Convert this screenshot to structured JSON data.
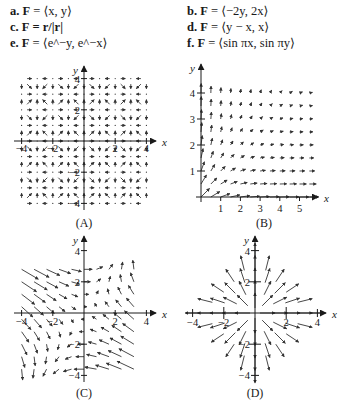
{
  "equations": [
    {
      "letter": "a.",
      "lhs": "F",
      "rhs": "= ⟨x, y⟩",
      "col": 0,
      "row": 0
    },
    {
      "letter": "b.",
      "lhs": "F",
      "rhs": "= ⟨−2y, 2x⟩",
      "col": 1,
      "row": 0
    },
    {
      "letter": "c.",
      "lhs": "F",
      "rhs": "= r/|r|",
      "col": 0,
      "row": 1
    },
    {
      "letter": "d.",
      "lhs": "F",
      "rhs": "= ⟨y − x, x⟩",
      "col": 1,
      "row": 1
    },
    {
      "letter": "e.",
      "lhs": "F",
      "rhs": "= ⟨e^−y, e^−x⟩",
      "col": 0,
      "row": 2
    },
    {
      "letter": "f.",
      "lhs": "F",
      "rhs": "= ⟨sin πx, sin πy⟩",
      "col": 1,
      "row": 2
    }
  ],
  "plots": [
    {
      "id": "A",
      "caption": "(A)",
      "field": "sin_pi",
      "xlabel": "x",
      "ylabel": "y",
      "xticks": [
        "−4",
        "−2",
        "2",
        "4"
      ],
      "yticks": [
        "4",
        "2",
        "−2",
        "−4"
      ]
    },
    {
      "id": "B",
      "caption": "(B)",
      "field": "exp",
      "xlabel": "x",
      "ylabel": "y",
      "xticks": [
        "1",
        "2",
        "3",
        "4",
        "5"
      ],
      "yticks": [
        "1",
        "2",
        "3",
        "4"
      ]
    },
    {
      "id": "C",
      "caption": "(C)",
      "field": "yminusx",
      "xlabel": "x",
      "ylabel": "y",
      "xticks": [
        "−4",
        "−2",
        "2",
        "4"
      ],
      "yticks": [
        "4",
        "2",
        "−2",
        "−4"
      ]
    },
    {
      "id": "D",
      "caption": "(D)",
      "field": "radial",
      "xlabel": "x",
      "ylabel": "y",
      "xticks": [
        "−4",
        "−2",
        "2",
        "4"
      ],
      "yticks": [
        "4",
        "2",
        "−2",
        "−4"
      ]
    }
  ],
  "colors": {
    "ink": "#1a1a1a",
    "arrow": "#333333",
    "background": "#ffffff"
  }
}
